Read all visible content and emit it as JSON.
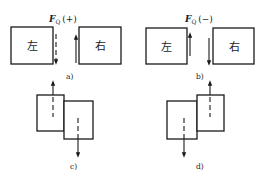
{
  "diagram": {
    "panels": [
      {
        "id": "a",
        "caption": "a)",
        "force_symbol": "F",
        "force_subscript": "Q",
        "sign": "(+)",
        "left_label": "左",
        "right_label": "右",
        "left_arrow": "down",
        "right_arrow": "up"
      },
      {
        "id": "b",
        "caption": "b)",
        "force_symbol": "F",
        "force_subscript": "Q",
        "sign": "(−)",
        "left_label": "左",
        "right_label": "右",
        "left_arrow": "up",
        "right_arrow": "down"
      },
      {
        "id": "c",
        "caption": "c)",
        "description": "Left segment raised, right segment lowered (positive shear deformation)"
      },
      {
        "id": "d",
        "caption": "d)",
        "description": "Left segment lowered, right segment raised (negative shear deformation)"
      }
    ],
    "colors": {
      "line": "#1a1a1a",
      "background": "#ffffff"
    }
  }
}
